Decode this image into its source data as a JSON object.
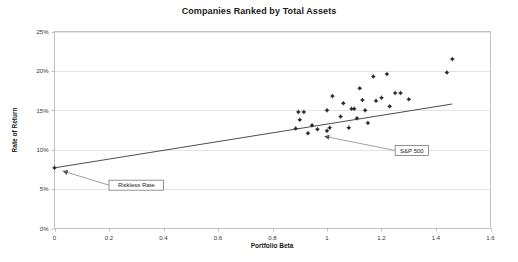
{
  "chart_data": {
    "type": "scatter",
    "title": "Companies Ranked by Total Assets",
    "xlabel": "Portfolio Beta",
    "ylabel": "Rate of Return",
    "xlim": [
      0,
      1.6
    ],
    "ylim": [
      0,
      0.25
    ],
    "xticks": [
      "0",
      "0.2",
      "0.4",
      "0.6",
      "0.8",
      "1",
      "1.2",
      "1.4",
      "1.6"
    ],
    "xtick_values": [
      0,
      0.2,
      0.4,
      0.6,
      0.8,
      1.0,
      1.2,
      1.4,
      1.6
    ],
    "yticks": [
      "0%",
      "5%",
      "10%",
      "15%",
      "20%",
      "25%"
    ],
    "ytick_values": [
      0,
      0.05,
      0.1,
      0.15,
      0.2,
      0.25
    ],
    "grid": "horizontal",
    "legend": "none",
    "point_color": "#2b2b2b",
    "line_color": "#4d4d4d",
    "series": [
      {
        "name": "Companies",
        "points": [
          {
            "x": 0.0,
            "y": 0.077
          },
          {
            "x": 0.885,
            "y": 0.127
          },
          {
            "x": 0.895,
            "y": 0.148
          },
          {
            "x": 0.9,
            "y": 0.138
          },
          {
            "x": 0.915,
            "y": 0.148
          },
          {
            "x": 0.93,
            "y": 0.121
          },
          {
            "x": 0.945,
            "y": 0.131
          },
          {
            "x": 0.965,
            "y": 0.126
          },
          {
            "x": 1.0,
            "y": 0.124
          },
          {
            "x": 1.0,
            "y": 0.15
          },
          {
            "x": 1.01,
            "y": 0.128
          },
          {
            "x": 1.02,
            "y": 0.168
          },
          {
            "x": 1.05,
            "y": 0.142
          },
          {
            "x": 1.06,
            "y": 0.159
          },
          {
            "x": 1.08,
            "y": 0.128
          },
          {
            "x": 1.09,
            "y": 0.152
          },
          {
            "x": 1.1,
            "y": 0.152
          },
          {
            "x": 1.11,
            "y": 0.14
          },
          {
            "x": 1.12,
            "y": 0.178
          },
          {
            "x": 1.13,
            "y": 0.163
          },
          {
            "x": 1.14,
            "y": 0.15
          },
          {
            "x": 1.15,
            "y": 0.134
          },
          {
            "x": 1.17,
            "y": 0.193
          },
          {
            "x": 1.18,
            "y": 0.162
          },
          {
            "x": 1.2,
            "y": 0.166
          },
          {
            "x": 1.22,
            "y": 0.196
          },
          {
            "x": 1.23,
            "y": 0.155
          },
          {
            "x": 1.25,
            "y": 0.172
          },
          {
            "x": 1.27,
            "y": 0.172
          },
          {
            "x": 1.3,
            "y": 0.164
          },
          {
            "x": 1.44,
            "y": 0.198
          },
          {
            "x": 1.46,
            "y": 0.215
          }
        ]
      }
    ],
    "trend_line": {
      "name": "Security Market Line",
      "x_start": 0.0,
      "y_start": 0.077,
      "x_end": 1.46,
      "y_end": 0.158
    },
    "annotations": [
      {
        "label": "Riskless Rate",
        "target_x": 0.03,
        "target_y": 0.073,
        "box_x": 0.2,
        "box_y": 0.055
      },
      {
        "label": "S&P 500",
        "target_x": 0.99,
        "target_y": 0.117,
        "box_x": 1.25,
        "box_y": 0.099
      }
    ]
  }
}
